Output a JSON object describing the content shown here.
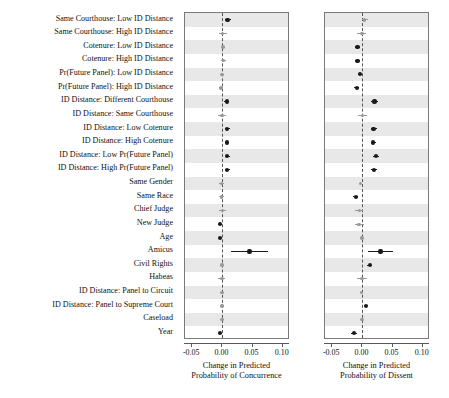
{
  "chart_data": {
    "type": "scatter",
    "plot_kind": "coefficient-dot-whisker",
    "title": "",
    "categories": [
      "Same Courthouse: Low ID Distance",
      "Same Courthouse: High ID Distance",
      "Cotenure: Low ID Distance",
      "Cotenure: High ID Distance",
      "Pr(Future Panel): Low ID Distance",
      "Pr(Future Panel): High ID Distance",
      "ID Distance: Different Courthouse",
      "ID Distance: Same Courthouse",
      "ID Distance: Low Cotenure",
      "ID Distance: High Cotenure",
      "ID Distance: Low Pr(Future Panel)",
      "ID Distance: High Pr(Future Panel)",
      "Same Gender",
      "Same Race",
      "Chief Judge",
      "New Judge",
      "Age",
      "Amicus",
      "Civil Rights",
      "Habeas",
      "ID Distance: Panel to Circuit",
      "ID Distance: Panel to Supreme Court",
      "Caseload",
      "Year"
    ],
    "xlim": [
      -0.062,
      0.112
    ],
    "xticks": [
      -0.05,
      0.0,
      0.05,
      0.1
    ],
    "xticklabels": [
      "-0.05",
      "0.00",
      "0.05",
      "0.10"
    ],
    "grid": false,
    "legend": "none",
    "zero_reference_line": 0.0,
    "significant_color": "#1a1a1a",
    "nonsignificant_color": "#9a9a9a",
    "band_color": "#e8e8e8",
    "panels": [
      {
        "name": "concurrence",
        "xlabel_line1": "Change in Predicted",
        "xlabel_line2": "Probability of Concurrence",
        "series": [
          {
            "value": 0.0085,
            "low": 0.0035,
            "high": 0.015,
            "significant": true
          },
          {
            "value": 0.0005,
            "low": -0.005,
            "high": 0.0075,
            "significant": false
          },
          {
            "value": 0.001,
            "low": -0.0025,
            "high": 0.0045,
            "significant": false
          },
          {
            "value": 0.0015,
            "low": -0.003,
            "high": 0.006,
            "significant": false
          },
          {
            "value": -0.001,
            "low": -0.004,
            "high": 0.002,
            "significant": false
          },
          {
            "value": -0.0025,
            "low": -0.0055,
            "high": 0.0005,
            "significant": false
          },
          {
            "value": 0.007,
            "low": 0.003,
            "high": 0.0115,
            "significant": true
          },
          {
            "value": -0.0005,
            "low": -0.0075,
            "high": 0.0065,
            "significant": false
          },
          {
            "value": 0.0075,
            "low": 0.0035,
            "high": 0.012,
            "significant": true
          },
          {
            "value": 0.0075,
            "low": 0.004,
            "high": 0.0115,
            "significant": true
          },
          {
            "value": 0.008,
            "low": 0.0035,
            "high": 0.0125,
            "significant": true
          },
          {
            "value": 0.008,
            "low": 0.004,
            "high": 0.0125,
            "significant": true
          },
          {
            "value": -0.0015,
            "low": -0.005,
            "high": 0.002,
            "significant": false
          },
          {
            "value": -0.002,
            "low": -0.006,
            "high": 0.002,
            "significant": false
          },
          {
            "value": 0.0,
            "low": -0.006,
            "high": 0.006,
            "significant": false
          },
          {
            "value": -0.0045,
            "low": -0.008,
            "high": -0.001,
            "significant": true
          },
          {
            "value": -0.0035,
            "low": -0.0055,
            "high": -0.0015,
            "significant": true
          },
          {
            "value": 0.045,
            "low": 0.014,
            "high": 0.076,
            "significant": true
          },
          {
            "value": -0.0005,
            "low": -0.0035,
            "high": 0.0025,
            "significant": false
          },
          {
            "value": -0.001,
            "low": -0.007,
            "high": 0.005,
            "significant": false
          },
          {
            "value": -0.0005,
            "low": -0.004,
            "high": 0.003,
            "significant": false
          },
          {
            "value": -0.001,
            "low": -0.0045,
            "high": 0.0025,
            "significant": false
          },
          {
            "value": -0.001,
            "low": -0.004,
            "high": 0.002,
            "significant": false
          },
          {
            "value": -0.0045,
            "low": -0.008,
            "high": -0.001,
            "significant": true
          }
        ]
      },
      {
        "name": "dissent",
        "xlabel_line1": "Change in Predicted",
        "xlabel_line2": "Probability of Dissent",
        "series": [
          {
            "value": 0.0035,
            "low": 0.0,
            "high": 0.01,
            "significant": false
          },
          {
            "value": -0.001,
            "low": -0.0095,
            "high": 0.0055,
            "significant": false
          },
          {
            "value": -0.008,
            "low": -0.012,
            "high": -0.004,
            "significant": true
          },
          {
            "value": -0.008,
            "low": -0.012,
            "high": -0.004,
            "significant": true
          },
          {
            "value": -0.004,
            "low": -0.0075,
            "high": -0.0005,
            "significant": true
          },
          {
            "value": -0.0095,
            "low": -0.0135,
            "high": -0.0055,
            "significant": true
          },
          {
            "value": 0.02,
            "low": 0.015,
            "high": 0.0255,
            "significant": true
          },
          {
            "value": 0.0,
            "low": -0.0075,
            "high": 0.008,
            "significant": false
          },
          {
            "value": 0.0185,
            "low": 0.014,
            "high": 0.0235,
            "significant": true
          },
          {
            "value": 0.018,
            "low": 0.014,
            "high": 0.0225,
            "significant": true
          },
          {
            "value": 0.0225,
            "low": 0.0175,
            "high": 0.028,
            "significant": true
          },
          {
            "value": 0.0195,
            "low": 0.015,
            "high": 0.0245,
            "significant": true
          },
          {
            "value": -0.003,
            "low": -0.006,
            "high": 0.0,
            "significant": false
          },
          {
            "value": -0.011,
            "low": -0.015,
            "high": -0.007,
            "significant": true
          },
          {
            "value": -0.005,
            "low": -0.0115,
            "high": 0.0015,
            "significant": false
          },
          {
            "value": -0.0055,
            "low": -0.013,
            "high": 0.002,
            "significant": false
          },
          {
            "value": -0.001,
            "low": -0.0035,
            "high": 0.0015,
            "significant": false
          },
          {
            "value": 0.03,
            "low": 0.01,
            "high": 0.05,
            "significant": true
          },
          {
            "value": 0.012,
            "low": 0.0075,
            "high": 0.0165,
            "significant": true
          },
          {
            "value": -0.001,
            "low": -0.009,
            "high": 0.007,
            "significant": false
          },
          {
            "value": -0.0015,
            "low": -0.0045,
            "high": 0.0015,
            "significant": false
          },
          {
            "value": 0.0055,
            "low": 0.002,
            "high": 0.009,
            "significant": true
          },
          {
            "value": -0.001,
            "low": -0.0035,
            "high": 0.0015,
            "significant": false
          },
          {
            "value": -0.014,
            "low": -0.0185,
            "high": -0.0095,
            "significant": true
          }
        ]
      }
    ]
  }
}
